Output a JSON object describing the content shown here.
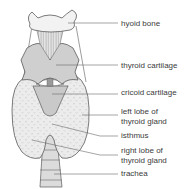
{
  "diagram": {
    "labels": {
      "hyoid_bone": "hyoid bone",
      "thyroid_cartilage": "thyroid cartilage",
      "cricoid_cartilage": "cricoid cartilage",
      "left_lobe_line1": "left lobe of",
      "left_lobe_line2": "thyroid gland",
      "isthmus": "isthmus",
      "right_lobe_line1": "right lobe of",
      "right_lobe_line2": "thyroid gland",
      "trachea": "trachea"
    },
    "colors": {
      "outline": "#5a5a5a",
      "cartilage_fill": "#cfcfcf",
      "gland_fill": "#ececec",
      "bone_fill": "#f2f2f2",
      "leader_line": "#6a6a6a",
      "label_text": "#3c3c3c"
    }
  }
}
